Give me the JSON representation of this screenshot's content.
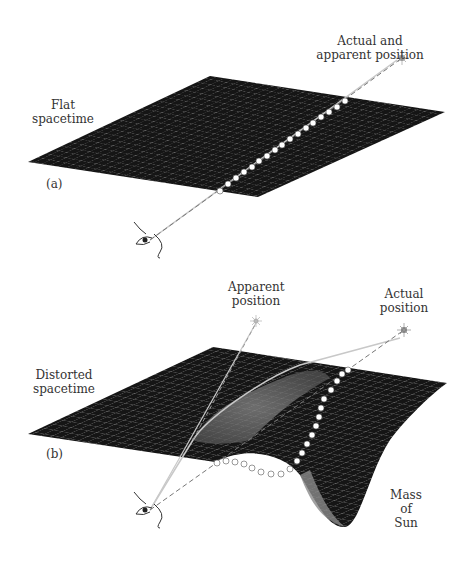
{
  "panel_a": {
    "tag": "(a)",
    "surface_label_1": "Flat",
    "surface_label_2": "spacetime",
    "star_label_1": "Actual and",
    "star_label_2": "apparent position"
  },
  "panel_b": {
    "tag": "(b)",
    "surface_label_1": "Distorted",
    "surface_label_2": "spacetime",
    "apparent_label_1": "Apparent",
    "apparent_label_2": "position",
    "actual_label_1": "Actual",
    "actual_label_2": "position",
    "mass_label_1": "Mass",
    "mass_label_2": "of",
    "mass_label_3": "Sun"
  },
  "colors": {
    "surface": "#151515",
    "grid": "#9a9a9a",
    "light_path": "#c8c8c8",
    "sightline": "#777777",
    "dots": "#ffffff"
  }
}
